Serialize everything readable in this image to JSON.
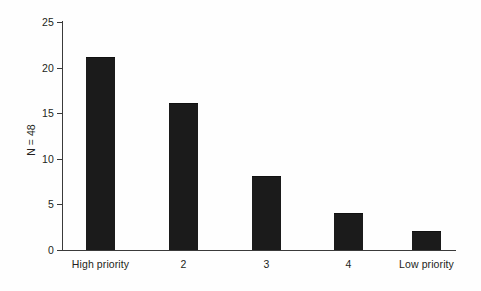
{
  "chart_data": {
    "type": "bar",
    "title": "",
    "xlabel": "",
    "ylabel": "N = 48",
    "categories": [
      "High priority",
      "2",
      "3",
      "4",
      "Low priority"
    ],
    "values": [
      21,
      16,
      8,
      4,
      2
    ],
    "ylim": [
      0,
      25
    ],
    "yticks": [
      0,
      5,
      10,
      15,
      20,
      25
    ],
    "ytick_labels": [
      "0",
      "5",
      "10",
      "15",
      "20",
      "25"
    ],
    "grid": false,
    "legend": null,
    "bar_color": "#1b1b1b",
    "axis_color": "#3a3a3a",
    "background_color": "#fefefe"
  }
}
